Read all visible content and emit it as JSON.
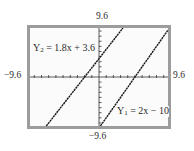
{
  "chart_data": {
    "type": "line",
    "title": "",
    "xlabel": "",
    "ylabel": "",
    "xlim": [
      -9.6,
      9.6
    ],
    "ylim": [
      -9.6,
      9.6
    ],
    "x_tick_step": 1,
    "y_tick_step": 1,
    "grid": false,
    "window_labels": {
      "ymax": "9.6",
      "ymin": "−9.6",
      "xmin": "−9.6",
      "xmax": "9.6"
    },
    "series": [
      {
        "name": "Y1",
        "label_prefix": "Y",
        "label_sub": "1",
        "label_rhs": "= 2x − 10",
        "equation": "2x - 10",
        "slope": 2,
        "intercept": -10,
        "x": [
          0.2,
          9.6
        ],
        "y": [
          -9.6,
          9.2
        ]
      },
      {
        "name": "Y2",
        "label_prefix": "Y",
        "label_sub": "2",
        "label_rhs": "= 1.8x + 3.6",
        "equation": "1.8x + 3.6",
        "slope": 1.8,
        "intercept": 3.6,
        "x": [
          -7.333,
          3.333
        ],
        "y": [
          -9.6,
          9.6
        ]
      }
    ]
  },
  "colors": {
    "frame": "#9c9c9c",
    "background": "#fbfbfb",
    "line": "#1a1a1a"
  }
}
